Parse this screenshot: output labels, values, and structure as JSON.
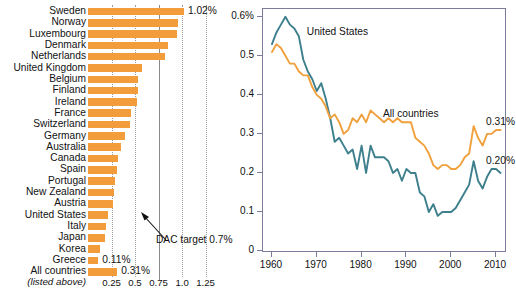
{
  "chart_data": [
    {
      "type": "bar",
      "title": "",
      "xlabel": "",
      "ylabel": "",
      "orientation": "horizontal",
      "xlim": [
        0,
        1.35
      ],
      "xticks": [
        0.25,
        0.5,
        0.75,
        1.0,
        1.25
      ],
      "xtick_labels": [
        "0.25",
        "0.5",
        "0.75",
        "1.0",
        "1.25"
      ],
      "grid": true,
      "unit": "%",
      "bar_color": "#F39C3C",
      "reference_line": {
        "value": 0.7,
        "label": "DAC target 0.7%"
      },
      "categories": [
        "Sweden",
        "Norway",
        "Luxembourg",
        "Denmark",
        "Netherlands",
        "United Kingdom",
        "Belgium",
        "Finland",
        "Ireland",
        "France",
        "Switzerland",
        "Germany",
        "Australia",
        "Canada",
        "Spain",
        "Portugal",
        "New Zealand",
        "Austria",
        "United States",
        "Italy",
        "Japan",
        "Korea",
        "Greece",
        "All countries"
      ],
      "values": [
        1.02,
        0.96,
        0.95,
        0.85,
        0.82,
        0.57,
        0.53,
        0.53,
        0.52,
        0.46,
        0.45,
        0.39,
        0.35,
        0.32,
        0.31,
        0.29,
        0.28,
        0.27,
        0.21,
        0.19,
        0.18,
        0.13,
        0.11,
        0.31
      ],
      "data_labels": [
        {
          "category": "Sweden",
          "text": "1.02%"
        },
        {
          "category": "Greece",
          "text": "0.11%"
        },
        {
          "category": "All countries",
          "text": "0.31%"
        }
      ],
      "footnote": "(listed above)"
    },
    {
      "type": "line",
      "title": "",
      "xlabel": "",
      "ylabel": "",
      "xlim": [
        1958,
        2012
      ],
      "ylim": [
        0,
        0.62
      ],
      "yticks": [
        0,
        0.1,
        0.2,
        0.3,
        0.4,
        0.5,
        0.6
      ],
      "ytick_labels": [
        "0",
        "0.1",
        "0.2",
        "0.3",
        "0.4",
        "0.5",
        "0.6%"
      ],
      "xticks": [
        1960,
        1970,
        1980,
        1990,
        2000,
        2010
      ],
      "xtick_labels": [
        "1960",
        "1970",
        "1980",
        "1990",
        "2000",
        "2010"
      ],
      "grid": false,
      "unit": "%",
      "annotations": [
        {
          "text": "United States",
          "x": 1968,
          "y": 0.555
        },
        {
          "text": "All countries",
          "x": 1985,
          "y": 0.345
        },
        {
          "text": "0.31%",
          "x": 2008,
          "y": 0.325
        },
        {
          "text": "0.20%",
          "x": 2008,
          "y": 0.225
        }
      ],
      "series": [
        {
          "name": "United States",
          "color": "#3D7F8C",
          "end_label": "0.20%",
          "x": [
            1960,
            1961,
            1962,
            1963,
            1964,
            1965,
            1966,
            1967,
            1968,
            1969,
            1970,
            1971,
            1972,
            1973,
            1974,
            1975,
            1976,
            1977,
            1978,
            1979,
            1980,
            1981,
            1982,
            1983,
            1984,
            1985,
            1986,
            1987,
            1988,
            1989,
            1990,
            1991,
            1992,
            1993,
            1994,
            1995,
            1996,
            1997,
            1998,
            1999,
            2000,
            2001,
            2002,
            2003,
            2004,
            2005,
            2006,
            2007,
            2008,
            2009,
            2010,
            2011
          ],
          "values": [
            0.53,
            0.56,
            0.58,
            0.6,
            0.58,
            0.57,
            0.55,
            0.49,
            0.46,
            0.44,
            0.41,
            0.43,
            0.39,
            0.34,
            0.28,
            0.29,
            0.27,
            0.25,
            0.26,
            0.21,
            0.27,
            0.2,
            0.27,
            0.24,
            0.24,
            0.24,
            0.23,
            0.2,
            0.21,
            0.18,
            0.21,
            0.2,
            0.2,
            0.15,
            0.14,
            0.1,
            0.12,
            0.09,
            0.1,
            0.1,
            0.1,
            0.11,
            0.13,
            0.15,
            0.17,
            0.23,
            0.18,
            0.16,
            0.19,
            0.21,
            0.21,
            0.2
          ]
        },
        {
          "name": "All countries",
          "color": "#F0A03C",
          "end_label": "0.31%",
          "x": [
            1960,
            1961,
            1962,
            1963,
            1964,
            1965,
            1966,
            1967,
            1968,
            1969,
            1970,
            1971,
            1972,
            1973,
            1974,
            1975,
            1976,
            1977,
            1978,
            1979,
            1980,
            1981,
            1982,
            1983,
            1984,
            1985,
            1986,
            1987,
            1988,
            1989,
            1990,
            1991,
            1992,
            1993,
            1994,
            1995,
            1996,
            1997,
            1998,
            1999,
            2000,
            2001,
            2002,
            2003,
            2004,
            2005,
            2006,
            2007,
            2008,
            2009,
            2010,
            2011
          ],
          "values": [
            0.51,
            0.53,
            0.52,
            0.5,
            0.48,
            0.48,
            0.46,
            0.45,
            0.45,
            0.42,
            0.4,
            0.39,
            0.37,
            0.34,
            0.35,
            0.33,
            0.3,
            0.31,
            0.34,
            0.33,
            0.35,
            0.33,
            0.36,
            0.35,
            0.34,
            0.33,
            0.34,
            0.33,
            0.34,
            0.33,
            0.33,
            0.33,
            0.29,
            0.28,
            0.27,
            0.25,
            0.22,
            0.21,
            0.22,
            0.22,
            0.21,
            0.21,
            0.22,
            0.24,
            0.25,
            0.32,
            0.29,
            0.27,
            0.3,
            0.3,
            0.31,
            0.31
          ]
        }
      ]
    }
  ],
  "bar_panel": {
    "value_label_sweden": "1.02%",
    "value_label_greece": "0.11%",
    "value_label_all": "0.31%",
    "footnote": "(listed above)",
    "dac_note": "DAC target 0.7%"
  },
  "line_panel": {
    "note_us": "United States",
    "note_all": "All countries",
    "label_all_end": "0.31%",
    "label_us_end": "0.20%",
    "axis_pct_suffix": "%"
  }
}
